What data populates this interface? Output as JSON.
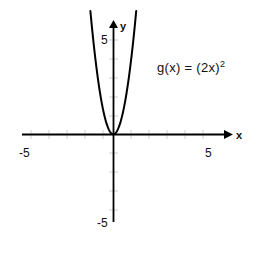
{
  "figure": {
    "background_color": "#ffffff",
    "axis_color": "#000000",
    "curve_color": "#000000",
    "tick_color": "#cfcfcf",
    "text_color": "#111111"
  },
  "annotation": {
    "function_label_base": "g(x) = (2x)",
    "function_label_exponent": "2",
    "function_label_full": "g(x) = (2x)²"
  },
  "axes": {
    "x_axis_label": "x",
    "y_axis_label": "y",
    "x_tick_labels": [
      "-5",
      "5"
    ],
    "y_tick_labels": [
      "5",
      "-5"
    ],
    "x_min_label": "-5",
    "x_max_label": "5",
    "y_max_label": "5",
    "y_min_label": "-5"
  },
  "chart_data": {
    "type": "line",
    "title": "",
    "xlabel": "x",
    "ylabel": "y",
    "xlim": [
      -5,
      5
    ],
    "ylim": [
      -5,
      5
    ],
    "grid": false,
    "legend": "none",
    "xticks": [
      -5,
      -4,
      -3,
      -2,
      -1,
      0,
      1,
      2,
      3,
      4,
      5
    ],
    "yticks": [
      -5,
      -4,
      -3,
      -2,
      -1,
      0,
      1,
      2,
      3,
      4,
      5
    ],
    "xtick_labels_shown": [
      "-5",
      "5"
    ],
    "ytick_labels_shown": [
      "5",
      "-5"
    ],
    "annotations": [
      {
        "text": "g(x) = (2x)²",
        "x": 3.3,
        "y": 3.6
      }
    ],
    "series": [
      {
        "name": "g(x) = (2x)^2",
        "expression": "g(x) = (2x)^2 = 4x^2",
        "color": "#000000",
        "x": [
          -0.62,
          -0.55,
          -0.5,
          -0.45,
          -0.4,
          -0.35,
          -0.3,
          -0.25,
          -0.2,
          -0.15,
          -0.1,
          -0.05,
          0,
          0.05,
          0.1,
          0.15,
          0.2,
          0.25,
          0.3,
          0.35,
          0.4,
          0.45,
          0.5,
          0.55,
          0.62
        ],
        "values": [
          1.5376,
          1.21,
          1.0,
          0.81,
          0.64,
          0.49,
          0.36,
          0.25,
          0.16,
          0.09,
          0.04,
          0.01,
          0,
          0.01,
          0.04,
          0.09,
          0.16,
          0.25,
          0.36,
          0.49,
          0.64,
          0.81,
          1.0,
          1.21,
          1.5376
        ]
      }
    ]
  }
}
